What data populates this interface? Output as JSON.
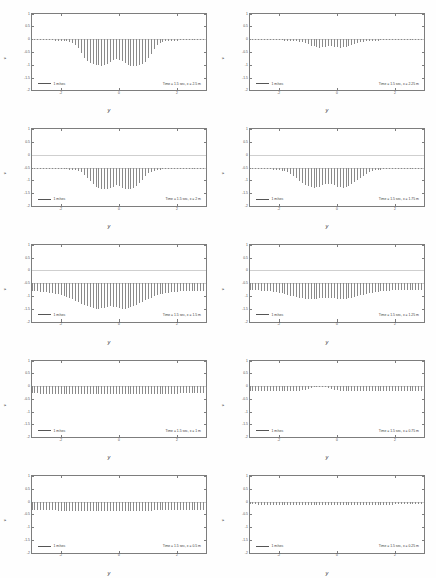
{
  "figure": {
    "title": "",
    "xlabel": "y",
    "ylabel": "v",
    "legend_label": "1 m/sec",
    "layout": "2 columns x 5 rows"
  },
  "chart_data": {
    "type": "line",
    "chart_family": "quiver-vector-field-grid",
    "xlabel": "y",
    "ylabel": "v",
    "xlim": [
      -3,
      3
    ],
    "ylim": [
      -2,
      1
    ],
    "xticks": [
      -2,
      0,
      2
    ],
    "xticklabels": [
      "-2",
      "0",
      "2"
    ],
    "yticks": [
      1,
      0.5,
      0,
      -0.5,
      -1,
      -1.5,
      -2
    ],
    "yticklabels": [
      "1",
      "0.5",
      "0",
      "-0.5",
      "-1",
      "-1.5",
      "-2"
    ],
    "grid": false,
    "legend_position": "lower-left",
    "legend_entries": [
      "1 m/sec"
    ],
    "panels": [
      {
        "index": 0,
        "row": 1,
        "col": 1,
        "annotation": "Time = 1.5 sec, x = 2.5 m",
        "time_sec": 1.5,
        "x_station_m": 2.5,
        "baseline_y": 0.0,
        "disturbance": "strong arch-shaped downward vortex lobe centered near y=0, spanning y = -1.2 to 1.2, peak downward magnitude ~1.1",
        "arrow_count": 61,
        "envelope": [
          0.02,
          0.02,
          0.02,
          0.03,
          0.03,
          0.03,
          0.04,
          0.04,
          0.05,
          0.05,
          0.06,
          0.07,
          0.08,
          0.1,
          0.14,
          0.22,
          0.36,
          0.55,
          0.74,
          0.86,
          0.93,
          0.97,
          1.0,
          1.02,
          1.03,
          1.02,
          0.98,
          0.9,
          0.82,
          0.78,
          0.8,
          0.86,
          0.93,
          1.0,
          1.04,
          1.05,
          1.04,
          1.01,
          0.96,
          0.88,
          0.74,
          0.56,
          0.37,
          0.22,
          0.14,
          0.1,
          0.08,
          0.07,
          0.06,
          0.05,
          0.05,
          0.04,
          0.04,
          0.03,
          0.03,
          0.03,
          0.02,
          0.02,
          0.02,
          0.02,
          0.02
        ]
      },
      {
        "index": 1,
        "row": 1,
        "col": 2,
        "annotation": "Time = 1.5 sec, x = 2.25 m",
        "time_sec": 1.5,
        "x_station_m": 2.25,
        "baseline_y": 0.0,
        "disturbance": "narrow shallow ripple packet near y=0, peak downward magnitude ~0.33",
        "arrow_count": 61,
        "envelope": [
          0.02,
          0.02,
          0.02,
          0.02,
          0.02,
          0.03,
          0.03,
          0.03,
          0.03,
          0.04,
          0.04,
          0.04,
          0.05,
          0.05,
          0.06,
          0.07,
          0.08,
          0.1,
          0.12,
          0.16,
          0.2,
          0.25,
          0.28,
          0.31,
          0.33,
          0.32,
          0.3,
          0.28,
          0.27,
          0.29,
          0.31,
          0.33,
          0.32,
          0.3,
          0.27,
          0.23,
          0.19,
          0.15,
          0.12,
          0.09,
          0.08,
          0.07,
          0.06,
          0.05,
          0.05,
          0.04,
          0.04,
          0.04,
          0.03,
          0.03,
          0.03,
          0.03,
          0.02,
          0.02,
          0.02,
          0.02,
          0.02,
          0.02,
          0.02,
          0.02,
          0.02
        ]
      },
      {
        "index": 2,
        "row": 2,
        "col": 1,
        "annotation": "Time = 1.5 sec, x = 2 m",
        "time_sec": 1.5,
        "x_station_m": 2.0,
        "baseline_y": -0.5,
        "disturbance": "compact bowl-shaped cluster centered at y=0, spanning y = -0.9 to 0.9, peak magnitude ~0.85",
        "arrow_count": 61,
        "envelope": [
          0.03,
          0.03,
          0.03,
          0.03,
          0.04,
          0.04,
          0.04,
          0.05,
          0.05,
          0.05,
          0.06,
          0.06,
          0.07,
          0.08,
          0.09,
          0.11,
          0.14,
          0.19,
          0.27,
          0.39,
          0.53,
          0.66,
          0.75,
          0.81,
          0.84,
          0.85,
          0.84,
          0.8,
          0.74,
          0.7,
          0.72,
          0.78,
          0.83,
          0.85,
          0.84,
          0.8,
          0.73,
          0.62,
          0.48,
          0.34,
          0.23,
          0.16,
          0.12,
          0.09,
          0.08,
          0.07,
          0.06,
          0.06,
          0.05,
          0.05,
          0.04,
          0.04,
          0.04,
          0.03,
          0.03,
          0.03,
          0.03,
          0.03,
          0.03,
          0.03,
          0.03
        ]
      },
      {
        "index": 3,
        "row": 2,
        "col": 2,
        "annotation": "Time = 1.5 sec, x = 1.75 m",
        "time_sec": 1.5,
        "x_station_m": 1.75,
        "baseline_y": -0.5,
        "disturbance": "broad oscillatory packet with central depression, spanning y = -1.4 to 1.4, peak magnitude ~0.78",
        "arrow_count": 61,
        "envelope": [
          0.04,
          0.04,
          0.05,
          0.05,
          0.05,
          0.06,
          0.06,
          0.07,
          0.08,
          0.09,
          0.1,
          0.12,
          0.15,
          0.19,
          0.25,
          0.33,
          0.42,
          0.52,
          0.61,
          0.68,
          0.73,
          0.76,
          0.78,
          0.77,
          0.74,
          0.7,
          0.66,
          0.64,
          0.66,
          0.7,
          0.74,
          0.77,
          0.78,
          0.76,
          0.72,
          0.66,
          0.58,
          0.49,
          0.4,
          0.31,
          0.24,
          0.18,
          0.14,
          0.11,
          0.09,
          0.08,
          0.07,
          0.06,
          0.06,
          0.05,
          0.05,
          0.05,
          0.04,
          0.04,
          0.04,
          0.04,
          0.04,
          0.04,
          0.04,
          0.04,
          0.04
        ]
      },
      {
        "index": 4,
        "row": 3,
        "col": 1,
        "annotation": "Time = 1.5 sec, x = 1.5 m",
        "time_sec": 1.5,
        "x_station_m": 1.5,
        "baseline_y": -0.5,
        "disturbance": "wide continuous oscillation across full span with amplified bulge near y=0, peak magnitude ~1.0",
        "arrow_count": 61,
        "envelope": [
          0.3,
          0.31,
          0.32,
          0.33,
          0.34,
          0.36,
          0.37,
          0.39,
          0.41,
          0.43,
          0.46,
          0.49,
          0.53,
          0.57,
          0.62,
          0.68,
          0.74,
          0.8,
          0.86,
          0.91,
          0.95,
          0.98,
          1.0,
          1.0,
          0.99,
          0.96,
          0.93,
          0.91,
          0.92,
          0.95,
          0.98,
          1.0,
          1.0,
          0.98,
          0.95,
          0.9,
          0.85,
          0.79,
          0.73,
          0.67,
          0.61,
          0.56,
          0.51,
          0.47,
          0.44,
          0.41,
          0.39,
          0.37,
          0.35,
          0.34,
          0.33,
          0.32,
          0.31,
          0.31,
          0.3,
          0.3,
          0.3,
          0.29,
          0.29,
          0.29,
          0.29
        ]
      },
      {
        "index": 5,
        "row": 3,
        "col": 2,
        "annotation": "Time = 1.5 sec, x = 1.25 m",
        "time_sec": 1.5,
        "x_station_m": 1.25,
        "baseline_y": -0.5,
        "disturbance": "uniform dense oscillation across span with mild central swell, peak magnitude ~0.62",
        "arrow_count": 61,
        "envelope": [
          0.26,
          0.27,
          0.27,
          0.28,
          0.29,
          0.3,
          0.31,
          0.32,
          0.34,
          0.36,
          0.38,
          0.4,
          0.43,
          0.46,
          0.49,
          0.52,
          0.55,
          0.57,
          0.59,
          0.61,
          0.62,
          0.62,
          0.61,
          0.6,
          0.58,
          0.57,
          0.56,
          0.56,
          0.57,
          0.59,
          0.61,
          0.62,
          0.62,
          0.61,
          0.59,
          0.57,
          0.54,
          0.51,
          0.48,
          0.45,
          0.42,
          0.39,
          0.37,
          0.35,
          0.33,
          0.32,
          0.3,
          0.29,
          0.29,
          0.28,
          0.28,
          0.27,
          0.27,
          0.26,
          0.26,
          0.26,
          0.26,
          0.26,
          0.26,
          0.26,
          0.26
        ]
      },
      {
        "index": 6,
        "row": 4,
        "col": 1,
        "annotation": "Time = 1.5 sec, x = 1 m",
        "time_sec": 1.5,
        "x_station_m": 1.0,
        "baseline_y": 0.0,
        "disturbance": "nearly uniform comb of short downward arrows across entire span, magnitude ~0.30",
        "arrow_count": 61,
        "envelope": [
          0.28,
          0.29,
          0.29,
          0.3,
          0.3,
          0.3,
          0.31,
          0.31,
          0.31,
          0.31,
          0.32,
          0.32,
          0.32,
          0.32,
          0.32,
          0.33,
          0.33,
          0.33,
          0.33,
          0.33,
          0.33,
          0.33,
          0.33,
          0.33,
          0.33,
          0.33,
          0.33,
          0.33,
          0.33,
          0.33,
          0.33,
          0.33,
          0.33,
          0.33,
          0.33,
          0.33,
          0.33,
          0.33,
          0.32,
          0.32,
          0.32,
          0.32,
          0.32,
          0.31,
          0.31,
          0.31,
          0.31,
          0.3,
          0.3,
          0.3,
          0.3,
          0.29,
          0.29,
          0.29,
          0.29,
          0.28,
          0.28,
          0.28,
          0.28,
          0.28,
          0.28
        ]
      },
      {
        "index": 7,
        "row": 4,
        "col": 2,
        "annotation": "Time = 1.5 sec, x = 0.75 m",
        "time_sec": 1.5,
        "x_station_m": 0.75,
        "baseline_y": 0.0,
        "disturbance": "uniform comb with slight gap near centre, magnitude ~0.20",
        "arrow_count": 61,
        "envelope": [
          0.2,
          0.2,
          0.2,
          0.2,
          0.21,
          0.21,
          0.21,
          0.21,
          0.21,
          0.21,
          0.21,
          0.21,
          0.21,
          0.21,
          0.21,
          0.21,
          0.2,
          0.19,
          0.17,
          0.14,
          0.1,
          0.07,
          0.05,
          0.04,
          0.04,
          0.04,
          0.05,
          0.07,
          0.1,
          0.14,
          0.17,
          0.19,
          0.2,
          0.21,
          0.21,
          0.21,
          0.21,
          0.21,
          0.21,
          0.21,
          0.21,
          0.21,
          0.21,
          0.21,
          0.21,
          0.21,
          0.21,
          0.21,
          0.2,
          0.2,
          0.2,
          0.2,
          0.2,
          0.2,
          0.2,
          0.2,
          0.2,
          0.2,
          0.2,
          0.2,
          0.2
        ]
      },
      {
        "index": 8,
        "row": 5,
        "col": 1,
        "annotation": "Time = 1.5 sec, x = 0.5 m",
        "time_sec": 1.5,
        "x_station_m": 0.5,
        "baseline_y": 0.0,
        "disturbance": "uniform dense comb of downward arrows, magnitude ~0.34, flat envelope",
        "arrow_count": 61,
        "envelope": [
          0.32,
          0.32,
          0.33,
          0.33,
          0.33,
          0.34,
          0.34,
          0.34,
          0.34,
          0.35,
          0.35,
          0.35,
          0.35,
          0.35,
          0.35,
          0.35,
          0.35,
          0.35,
          0.35,
          0.35,
          0.35,
          0.35,
          0.35,
          0.35,
          0.35,
          0.35,
          0.35,
          0.35,
          0.35,
          0.35,
          0.35,
          0.35,
          0.35,
          0.35,
          0.35,
          0.35,
          0.35,
          0.35,
          0.35,
          0.35,
          0.35,
          0.35,
          0.34,
          0.34,
          0.34,
          0.34,
          0.34,
          0.33,
          0.33,
          0.33,
          0.33,
          0.33,
          0.32,
          0.32,
          0.32,
          0.32,
          0.32,
          0.32,
          0.32,
          0.32,
          0.32
        ]
      },
      {
        "index": 9,
        "row": 5,
        "col": 2,
        "annotation": "Time = 1.5 sec, x = 0.25 m",
        "time_sec": 1.5,
        "x_station_m": 0.25,
        "baseline_y": 0.0,
        "disturbance": "very low flat comb of tiny downward arrows, magnitude ~0.12",
        "arrow_count": 61,
        "envelope": [
          0.11,
          0.11,
          0.11,
          0.12,
          0.12,
          0.12,
          0.12,
          0.12,
          0.12,
          0.12,
          0.12,
          0.12,
          0.12,
          0.12,
          0.12,
          0.12,
          0.12,
          0.12,
          0.12,
          0.12,
          0.12,
          0.12,
          0.12,
          0.12,
          0.12,
          0.12,
          0.12,
          0.12,
          0.12,
          0.12,
          0.12,
          0.12,
          0.12,
          0.12,
          0.12,
          0.12,
          0.12,
          0.12,
          0.12,
          0.12,
          0.12,
          0.12,
          0.12,
          0.12,
          0.12,
          0.12,
          0.12,
          0.12,
          0.12,
          0.12,
          0.11,
          0.11,
          0.11,
          0.11,
          0.11,
          0.11,
          0.11,
          0.11,
          0.11,
          0.11,
          0.11
        ]
      }
    ]
  },
  "colors": {
    "axis": "#7d7d7d",
    "arrow": "#8a8a8a",
    "zeroline": "#cfcfcf",
    "text": "#3a3a3a",
    "background": "#ffffff"
  }
}
